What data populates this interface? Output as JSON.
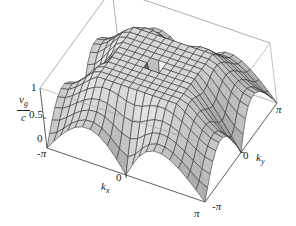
{
  "chart_data": {
    "type": "surface3d",
    "title": "",
    "zlabel": {
      "numerator": "v",
      "numerator_sub": "g",
      "denominator": "c"
    },
    "xlabel": {
      "main": "k",
      "sub": "x"
    },
    "ylabel": {
      "main": "k",
      "sub": "y"
    },
    "x_ticks": [
      "-π",
      "0",
      "π"
    ],
    "y_ticks": [
      "-π",
      "0",
      "π"
    ],
    "z_ticks": [
      "0",
      "0.5",
      "1"
    ],
    "xlim": [
      -3.1416,
      3.1416
    ],
    "ylim": [
      -3.1416,
      3.1416
    ],
    "zlim": [
      0,
      1
    ],
    "grid": true,
    "mesh_lines": 20,
    "colormap": "grayscale shading"
  },
  "colors": {
    "axis": "#333333",
    "box": "#9a9a9a",
    "mesh": "#2a2a2a"
  }
}
